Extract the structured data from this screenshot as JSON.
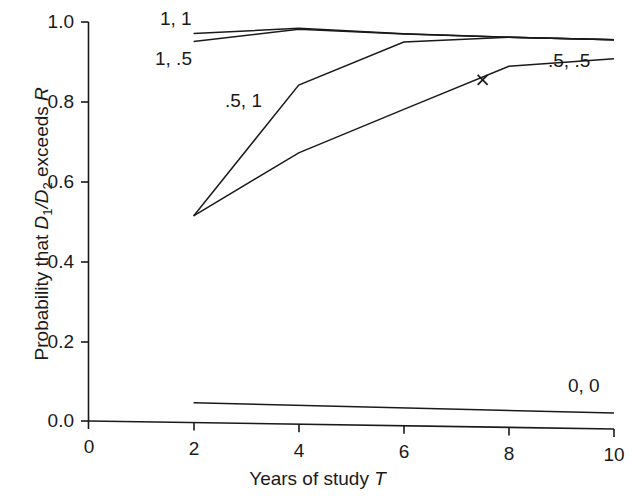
{
  "chart_data": {
    "type": "line",
    "title": "",
    "xlabel": "Years of study T",
    "ylabel": "Probability that D1/D2 exceeds R",
    "xlim": [
      0,
      10
    ],
    "ylim": [
      0.0,
      1.0
    ],
    "grid": false,
    "legend_position": "inline-annotations",
    "xticks": [
      "0",
      "2",
      "4",
      "6",
      "8",
      "10"
    ],
    "xtick_values": [
      0,
      2,
      4,
      6,
      8,
      10
    ],
    "yticks": [
      "0.0",
      "0.2",
      "0.4",
      "0.6",
      "0.8",
      "1.0"
    ],
    "ytick_values": [
      0.0,
      0.2,
      0.4,
      0.6,
      0.8,
      1.0
    ],
    "series": [
      {
        "name": "1, 1",
        "label": "1, 1",
        "x": [
          2,
          4,
          6,
          8,
          10
        ],
        "values": [
          0.975,
          0.9925,
          0.9825,
          0.978,
          0.9755
        ]
      },
      {
        "name": "1, .5",
        "label": "1, .5",
        "x": [
          2,
          4,
          6,
          8,
          10
        ],
        "values": [
          0.955,
          0.99,
          0.982,
          0.978,
          0.9755
        ]
      },
      {
        "name": ".5, 1",
        "label": ".5, 1",
        "x": [
          2,
          4,
          6,
          8,
          10
        ],
        "values": [
          0.518,
          0.85,
          0.962,
          0.978,
          0.9755
        ]
      },
      {
        "name": ".5, .5",
        "label": ".5, .5",
        "x": [
          2,
          4,
          6,
          8,
          10
        ],
        "values": [
          0.518,
          0.68,
          0.793,
          0.905,
          0.928
        ]
      },
      {
        "name": "0, 0",
        "label": "0, 0",
        "x": [
          2,
          10
        ],
        "values": [
          0.05,
          0.04
        ]
      }
    ],
    "markers": [
      {
        "name": "x-marker",
        "symbol": "x",
        "x": 7.5,
        "y": 0.87
      }
    ]
  },
  "axis": {
    "x_title_prefix": "Years of study ",
    "x_title_italic": "T",
    "y_title_part1": "Probability that ",
    "y_title_d1": "D",
    "y_title_d1_sub": "1",
    "y_title_slash": "/",
    "y_title_d2": "D",
    "y_title_d2_sub": "2",
    "y_title_part2": " exceeds ",
    "y_title_r": "R"
  },
  "labels": {
    "s11": "1, 1",
    "s1half": "1, .5",
    "shalf1": ".5, 1",
    "shalfhalf": ".5, .5",
    "s00": "0, 0"
  },
  "ytick_0": "1.0",
  "ytick_1": "0.8",
  "ytick_2": "0.6",
  "ytick_3": "0.4",
  "ytick_4": "0.2",
  "ytick_5": "0.0",
  "xtick_0": "0",
  "xtick_1": "2",
  "xtick_2": "4",
  "xtick_3": "6",
  "xtick_4": "8",
  "xtick_5": "10",
  "colors": {
    "line": "#1a1a1a",
    "axis": "#1a1a1a",
    "background": "#ffffff"
  }
}
